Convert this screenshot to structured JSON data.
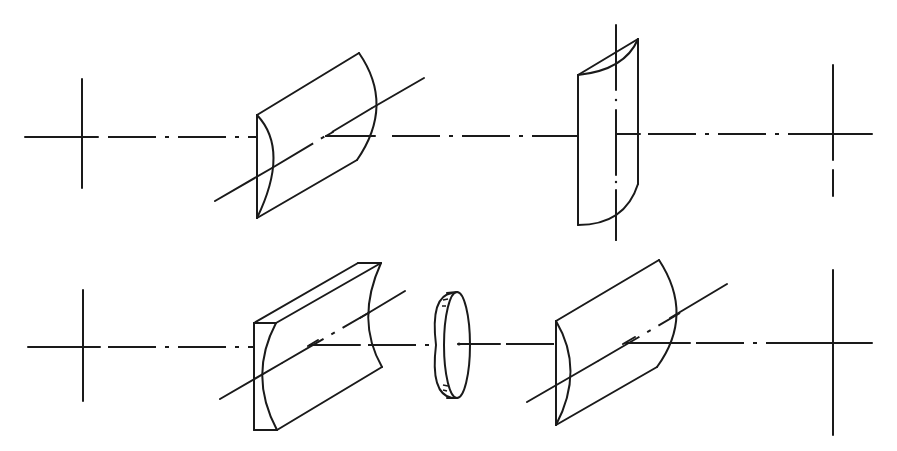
{
  "figure": {
    "type": "optical-system-diagram",
    "description": "Two optical arrangements drawn along dash-dot optical axes, each terminated by reference crosshairs",
    "colors": {
      "line": "#1a1a1a",
      "background": "#ffffff"
    }
  },
  "rows": [
    {
      "id": "top",
      "axis_y": 136,
      "elements": [
        {
          "name": "object-plane-crosshair",
          "kind": "crosshair"
        },
        {
          "name": "cylindrical-lens-plano-convex-tilted-axis",
          "kind": "cylindrical-lens"
        },
        {
          "name": "cylindrical-lens-vertical-axis",
          "kind": "cylindrical-lens"
        },
        {
          "name": "image-plane-crosshair",
          "kind": "crosshair"
        }
      ]
    },
    {
      "id": "bottom",
      "axis_y": 346,
      "elements": [
        {
          "name": "object-plane-crosshair",
          "kind": "crosshair"
        },
        {
          "name": "cylindrical-lens-plano-concave",
          "kind": "cylindrical-lens"
        },
        {
          "name": "spherical-disc-lens",
          "kind": "disc-lens"
        },
        {
          "name": "cylindrical-lens-plano-convex",
          "kind": "cylindrical-lens"
        },
        {
          "name": "image-plane-crosshair",
          "kind": "crosshair"
        }
      ]
    }
  ]
}
